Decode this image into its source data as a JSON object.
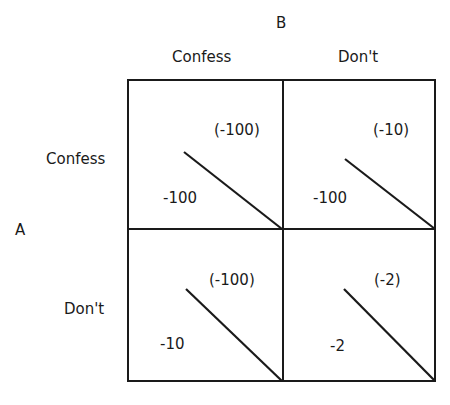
{
  "players": {
    "column_player": "B",
    "row_player": "A"
  },
  "columns": [
    {
      "label": "Confess"
    },
    {
      "label": "Don't"
    }
  ],
  "rows": [
    {
      "label": "Confess"
    },
    {
      "label": "Don't"
    }
  ],
  "cells": [
    [
      {
        "row_payoff": "-100",
        "col_payoff": "(-100)"
      },
      {
        "row_payoff": "-100",
        "col_payoff": "(-10)"
      }
    ],
    [
      {
        "row_payoff": "-10",
        "col_payoff": "(-100)"
      },
      {
        "row_payoff": "-2",
        "col_payoff": "(-2)"
      }
    ]
  ],
  "colors": {
    "line": "#1a1a1a",
    "background": "#ffffff"
  }
}
